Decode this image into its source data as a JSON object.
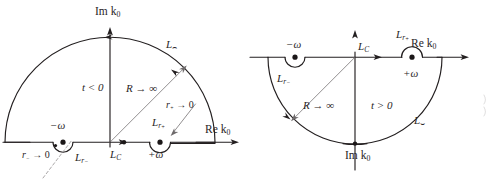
{
  "figure": {
    "background_color": "#ffffff",
    "line_color": "#231f20",
    "thin_line_color": "#6e6a6b",
    "pole_color": "#1b1718"
  },
  "left_panel": {
    "name": "upper-half-plane-contour",
    "time_condition": "t < 0",
    "axis_imaginary": "Im k",
    "axis_imaginary_sub": "0",
    "axis_real": "Re k",
    "axis_real_sub": "0",
    "radius_label": "R → ∞",
    "arc_label": "L",
    "arc_label_sub": "⌢",
    "contour_label": "L",
    "contour_label_sub": "C",
    "pole_minus": "−ω",
    "pole_plus": "+ω",
    "small_arc_minus": "L",
    "small_arc_minus_sub": "r",
    "small_arc_minus_subsub": "−",
    "small_arc_plus": "L",
    "small_arc_plus_sub": "r",
    "small_arc_plus_subsub": "+",
    "radius_minus_limit": "r",
    "radius_minus_limit_sub": "−",
    "radius_minus_limit_tail": " → 0",
    "radius_plus_limit": "r",
    "radius_plus_limit_sub": "+",
    "radius_plus_limit_tail": " → 0"
  },
  "right_panel": {
    "name": "lower-half-plane-contour",
    "time_condition": "t > 0",
    "axis_imaginary": "Im k",
    "axis_imaginary_sub": "0",
    "axis_real": "Re k",
    "axis_real_sub": "0",
    "radius_label": "R → ∞",
    "arc_label": "L",
    "arc_label_sub": "⌣",
    "contour_label": "L",
    "contour_label_sub": "C",
    "pole_minus": "−ω",
    "pole_plus": "+ω",
    "small_arc_minus": "L",
    "small_arc_minus_sub": "r",
    "small_arc_minus_subsub": "−",
    "small_arc_plus": "L",
    "small_arc_plus_sub": "r",
    "small_arc_plus_subsub": "+"
  }
}
